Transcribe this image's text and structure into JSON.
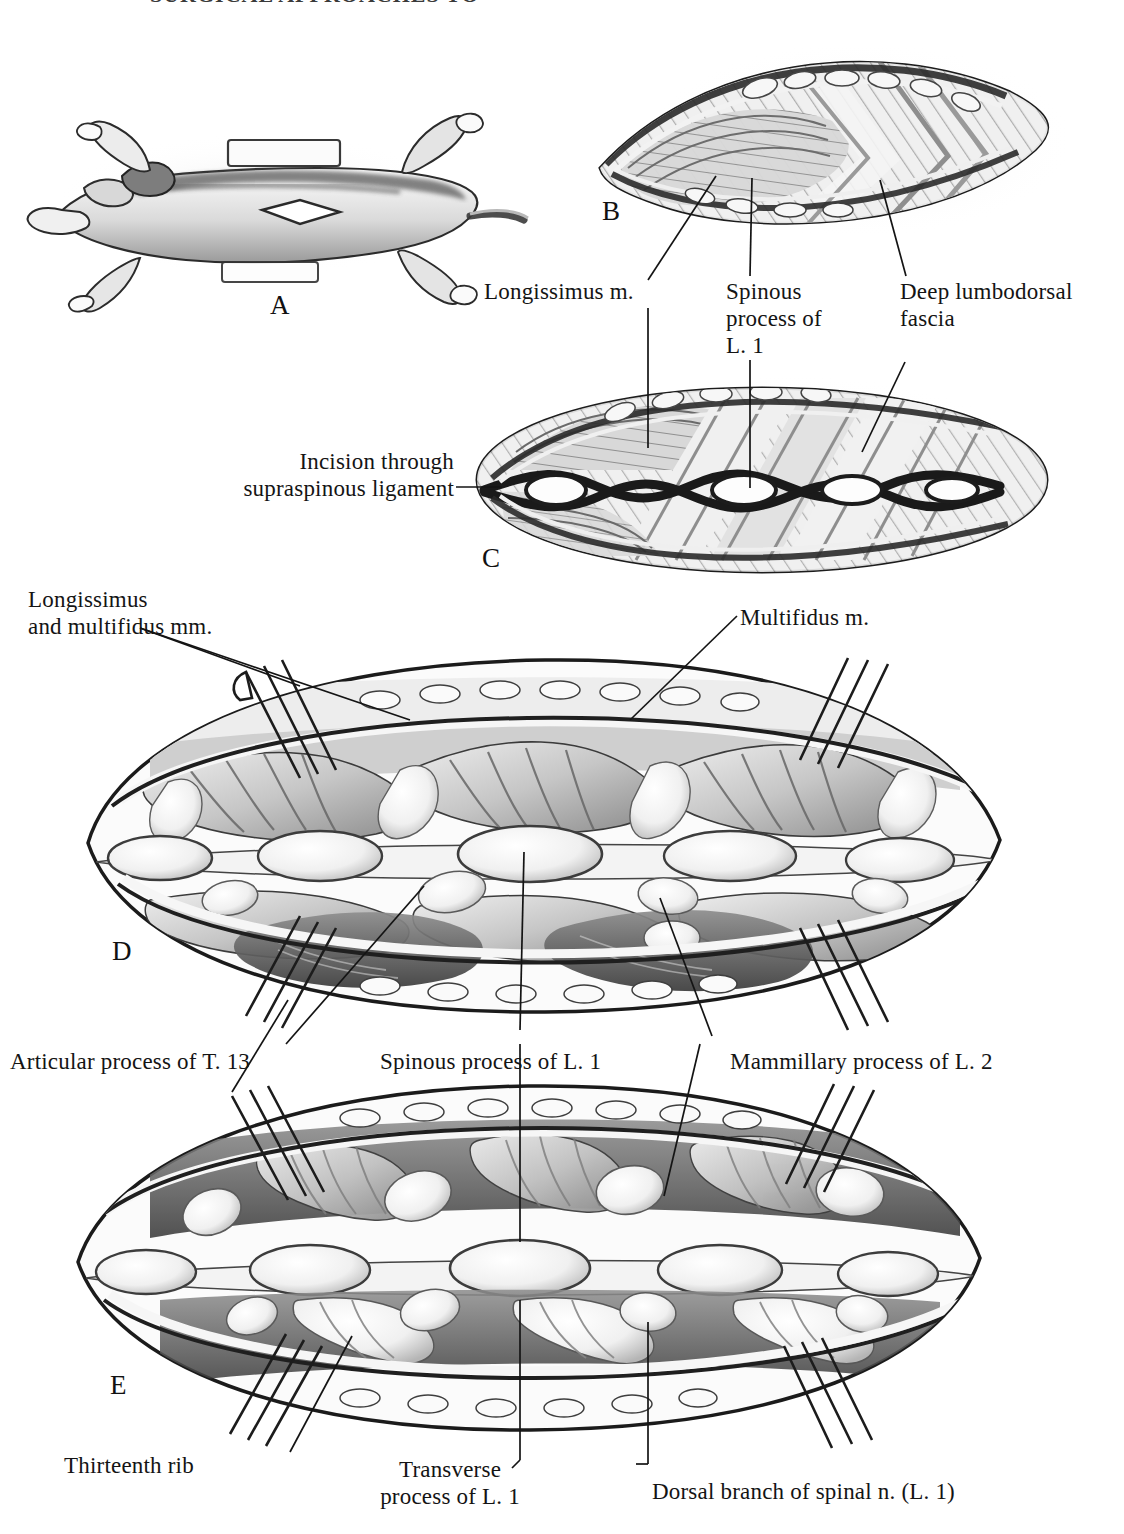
{
  "plate": {
    "title": "SURGICAL APPROACHES TO THE SPINE",
    "type": "anatomical-surgical-illustration",
    "subject": "Dorsal approach to the thoracolumbar spine of the dog",
    "panels": [
      {
        "letter": "A",
        "caption": "Dog positioned in sternal recumbency; skin incision outlined over the thoracolumbar region"
      },
      {
        "letter": "B",
        "caption": "Skin retracted to expose the deep lumbodorsal fascia and longissimus muscle"
      },
      {
        "letter": "C",
        "caption": "Incision through the supraspinous ligament exposing the spinous processes"
      },
      {
        "letter": "D",
        "caption": "Epaxial muscles elevated and retracted with four self-retaining retractors"
      },
      {
        "letter": "E",
        "caption": "Deeper dissection exposing articular, mammillary and transverse processes"
      }
    ]
  },
  "labels": {
    "longissimus_m": "Longissimus m.",
    "spinous_process_of_l1_multiline": "Spinous\nprocess of\nL. 1",
    "deep_lumbodorsal_fascia_multiline": "Deep lumbodorsal\nfascia",
    "incision_through_supraspinous_ligament_multiline": "Incision through\nsupraspinous ligament",
    "longissimus_and_multifidus_mm_multiline": "Longissimus\nand multifidus mm.",
    "multifidus_m": "Multifidus m.",
    "articular_process_of_t13": "Articular process of T. 13",
    "spinous_process_of_l1": "Spinous process of L. 1",
    "mammillary_process_of_l2": "Mammillary process of L. 2",
    "thirteenth_rib": "Thirteenth rib",
    "transverse_process_of_l1_multiline": "Transverse\nprocess of L. 1",
    "dorsal_branch_of_spinal_n_l1": "Dorsal branch of spinal n. (L. 1)"
  },
  "panel_letters": {
    "a": "A",
    "b": "B",
    "c": "C",
    "d": "D",
    "e": "E"
  },
  "colors": {
    "ink": "#141414",
    "paper": "#ffffff",
    "wash_light": "#e9e9e9",
    "wash_mid": "#bdbdbd",
    "wash_dark": "#6e6e6e",
    "wash_deep": "#3c3c3c"
  }
}
